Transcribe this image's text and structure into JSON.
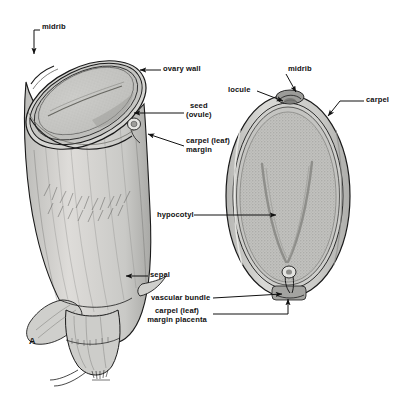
{
  "figure": {
    "panel_label": "A",
    "background_color": "#ffffff",
    "ink_color": "#111111",
    "fill_light": "#d8d8d6",
    "fill_mid": "#c3c3c1",
    "fill_dark": "#a9a9a7",
    "fill_seed": "#c9c9c6"
  },
  "labels": [
    {
      "id": "midrib-left",
      "text": "midrib",
      "x": 42,
      "y": 27,
      "align": "left"
    },
    {
      "id": "ovary-wall",
      "text": "ovary wall",
      "x": 163,
      "y": 68,
      "align": "left"
    },
    {
      "id": "seed-ovule",
      "text": "seed\n(ovule)",
      "x": 186,
      "y": 106,
      "align": "left"
    },
    {
      "id": "carpel-leaf-margin",
      "text": "carpel (leaf)\nmargin",
      "x": 186,
      "y": 140,
      "align": "left"
    },
    {
      "id": "sepal",
      "text": "sepal",
      "x": 150,
      "y": 273,
      "align": "left"
    },
    {
      "id": "midrib-right",
      "text": "midrib",
      "x": 281,
      "y": 69,
      "align": "left"
    },
    {
      "id": "locule",
      "text": "locule",
      "x": 232,
      "y": 88,
      "align": "left"
    },
    {
      "id": "carpel",
      "text": "carpel",
      "x": 366,
      "y": 99,
      "align": "left"
    },
    {
      "id": "hypocotyl",
      "text": "hypocotyl",
      "x": 160,
      "y": 212,
      "align": "left"
    },
    {
      "id": "vascular-bundle",
      "text": "vascular bundle",
      "x": 152,
      "y": 296,
      "align": "left"
    },
    {
      "id": "margin-placenta",
      "text": "carpel (leaf)\nmargin placenta",
      "x": 166,
      "y": 311,
      "align": "left"
    }
  ],
  "structures": {
    "left_view": "Oblique cut-away of a whole ovary showing the ovary wall, the enclosed seed (ovule), the carpel (leaf) margin and subtending sepals at the base.",
    "right_view": "Near-median section of the ovary showing carpel wall, locule, midrib, the stippled seed with V-shaped hypocotyl, and the vascular bundle entering at the carpel margin placenta."
  }
}
